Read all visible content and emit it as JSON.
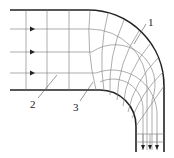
{
  "figure": {
    "type": "flow-net",
    "labels": [
      {
        "id": "1",
        "text": "1",
        "x": 148,
        "y": 24
      },
      {
        "id": "2",
        "text": "2",
        "x": 32,
        "y": 104
      },
      {
        "id": "3",
        "text": "3",
        "x": 74,
        "y": 108
      }
    ],
    "inflow_arrows": 3,
    "outflow_arrows": 3,
    "colors": {
      "wall": "#222222",
      "grid": "#777777"
    }
  }
}
